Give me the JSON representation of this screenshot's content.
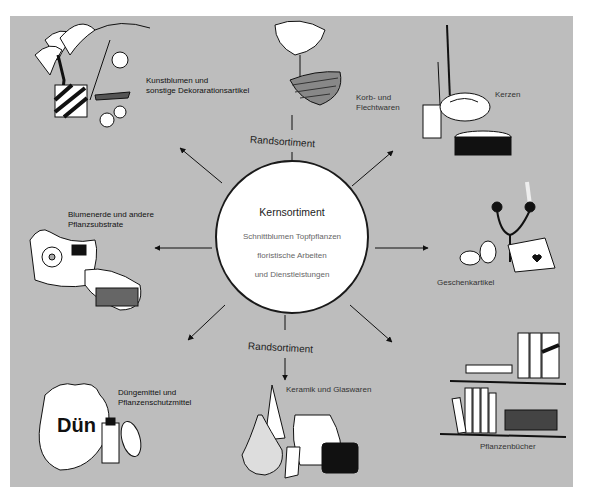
{
  "diagram": {
    "center": {
      "title": "Kernsortiment",
      "lines": [
        "Schnittblumen Topfpflanzen",
        "floristische Arbeiten",
        "und Dienstleistungen"
      ]
    },
    "ring_labels": {
      "top": "Randsortiment",
      "bottom": "Randsortiment"
    },
    "categories": [
      {
        "id": "kunstblumen",
        "lines": [
          "Kunstblumen und",
          "sonstige Dekorarationsartikel"
        ],
        "icon": "artificial-flowers-illustration"
      },
      {
        "id": "korb",
        "lines": [
          "Korb- und",
          "Flechtwaren"
        ],
        "icon": "basket-illustration"
      },
      {
        "id": "kerzen",
        "lines": [
          "Kerzen"
        ],
        "icon": "candles-illustration"
      },
      {
        "id": "blumenerde",
        "lines": [
          "Blumenerde und andere",
          "Pflanzsubstrate"
        ],
        "icon": "soil-bags-illustration"
      },
      {
        "id": "geschenk",
        "lines": [
          "Geschenkartikel"
        ],
        "icon": "gifts-illustration"
      },
      {
        "id": "duenge",
        "lines": [
          "Düngemittel und",
          "Pflanzenschutzmittel"
        ],
        "icon": "fertilizer-illustration"
      },
      {
        "id": "keramik",
        "lines": [
          "Keramik und Glaswaren"
        ],
        "icon": "ceramics-illustration"
      },
      {
        "id": "buecher",
        "lines": [
          "Pflanzenbücher"
        ],
        "icon": "books-illustration"
      }
    ],
    "illustration_texts": {
      "fertilizer_brand": "Dün",
      "fertilizer_sub": "Für schönere Blumen"
    }
  }
}
